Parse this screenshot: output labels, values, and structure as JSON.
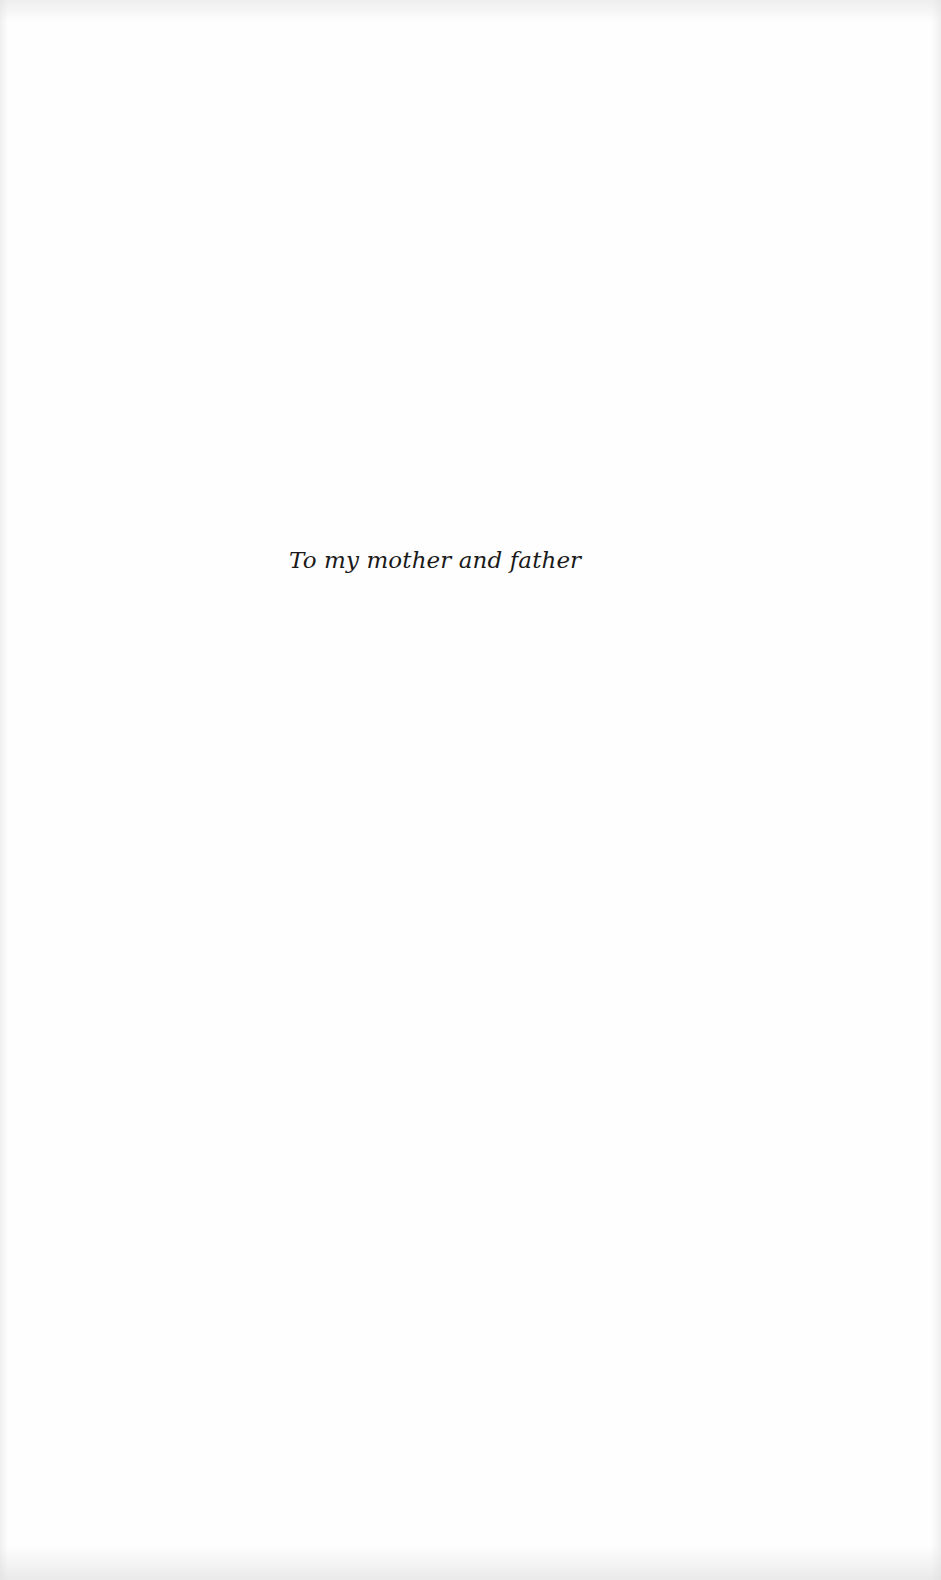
{
  "page": {
    "type": "dedication",
    "background_color": "#ffffff",
    "text_color": "#1a1a1a"
  },
  "dedication": {
    "text": "To my mother and father"
  }
}
